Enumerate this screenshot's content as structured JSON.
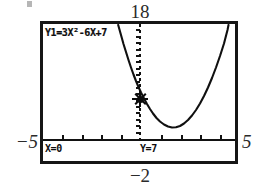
{
  "device": "graphing-calculator",
  "window": {
    "xmin_label": "−5",
    "xmax_label": "5",
    "ymin_label": "−2",
    "ymax_label": "18"
  },
  "screen": {
    "equation": "Y1=3X²-6X+7",
    "trace": {
      "x_readout": "X=0",
      "y_readout": "Y=7"
    }
  },
  "chart_data": {
    "type": "line",
    "title": "",
    "function": "y = 3x² − 6x + 7",
    "equation_display": "Y1=3X²-6X+7",
    "xlabel": "",
    "ylabel": "",
    "xlim": [
      -5,
      5
    ],
    "ylim": [
      -2,
      18
    ],
    "grid": false,
    "legend": null,
    "vertex": [
      1,
      4
    ],
    "y_intercept": [
      0,
      7
    ],
    "trace_point": {
      "x": 0,
      "y": 7,
      "label_x": "X=0",
      "label_y": "Y=7"
    },
    "x": [
      -1.05,
      -0.8,
      -0.6,
      -0.4,
      -0.2,
      0,
      0.25,
      0.5,
      0.75,
      1,
      1.25,
      1.5,
      1.75,
      2,
      2.25,
      2.5,
      2.75,
      3,
      3.05
    ],
    "values": [
      16.46,
      13.72,
      11.68,
      9.88,
      8.32,
      7,
      6.19,
      4.75,
      4.19,
      4,
      4.19,
      4.75,
      5.69,
      7,
      8.69,
      10.75,
      13.19,
      16,
      16.46
    ],
    "series": [
      {
        "name": "Y1",
        "expression": "3X^2-6X+7",
        "values": [
          16.46,
          13.72,
          11.68,
          9.88,
          8.32,
          7,
          6.19,
          4.75,
          4.19,
          4,
          4.19,
          4.75,
          5.69,
          7,
          8.69,
          10.75,
          13.19,
          16,
          16.46
        ]
      }
    ],
    "x_tick_values": [
      -4,
      -3,
      -2,
      -1,
      0,
      1,
      2,
      3,
      4
    ],
    "y_tick_values": [
      -1,
      1,
      2,
      3,
      4,
      5,
      6,
      7,
      8,
      9,
      10,
      11,
      12,
      13,
      14,
      15,
      16,
      17
    ]
  },
  "colors": {
    "ink": "#101010",
    "screen_bg": "#ffffff",
    "frame": "#161616"
  }
}
